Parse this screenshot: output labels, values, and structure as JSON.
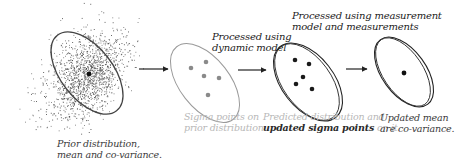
{
  "diagram": {
    "stages": [
      {
        "id": "prior",
        "caption_lines": [
          "Prior distribution,",
          "mean and co-variance."
        ]
      },
      {
        "id": "sigma",
        "caption_lines": [
          "Sigma points on",
          "prior distribution."
        ],
        "sigma_point_count": 5
      },
      {
        "id": "predicted",
        "caption_line1": "Predicted distribution and",
        "caption_line2_bold": "updated sigma points",
        "caption_line2_rest": " on it.",
        "sigma_point_count": 5
      },
      {
        "id": "updated",
        "caption_lines": [
          "Updated mean",
          "are co-variance."
        ]
      }
    ],
    "transitions": [
      {
        "from": "prior",
        "to": "sigma",
        "label_lines": []
      },
      {
        "from": "sigma",
        "to": "predicted",
        "label_lines": [
          "Processed using",
          "dynamic model"
        ]
      },
      {
        "from": "predicted",
        "to": "updated",
        "label_lines": [
          "Processed using measurement",
          "model and measurements"
        ]
      }
    ],
    "colors": {
      "ink": "#333333",
      "faded": "#9a9a9a",
      "faded_text": "#b8b8b8",
      "scatter": "#555555"
    }
  }
}
